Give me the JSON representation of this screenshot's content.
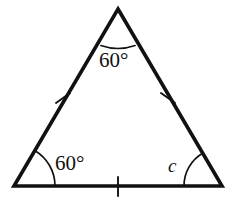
{
  "figure": {
    "type": "geometry-diagram",
    "shape": "equilateral-triangle",
    "background_color": "#ffffff",
    "stroke_color": "#111111",
    "canvas": {
      "width": 236,
      "height": 209
    }
  },
  "vertices": {
    "apex": {
      "label": "apex",
      "x": 118,
      "y": 9
    },
    "bottom_left": {
      "label": "bottom-left",
      "x": 14,
      "y": 186
    },
    "bottom_right": {
      "label": "bottom-right",
      "x": 222,
      "y": 186
    }
  },
  "labels": {
    "apex_angle": "60°",
    "bottom_left_angle": "60°",
    "bottom_right_angle": "c"
  },
  "angle_marks": [
    {
      "name": "apex-angle-arc",
      "vertex": "apex",
      "value": "60°",
      "radius": 38
    },
    {
      "name": "bottom-left-angle-arc",
      "vertex": "bottom_left",
      "value": "60°",
      "radius": 41
    },
    {
      "name": "bottom-right-angle-arc",
      "vertex": "bottom_right",
      "value": "c",
      "radius": 38
    }
  ],
  "side_marks": [
    {
      "name": "left-side-tick",
      "side": "left",
      "ticks": 1
    },
    {
      "name": "right-side-tick",
      "side": "right",
      "ticks": 1
    },
    {
      "name": "base-tick",
      "side": "base",
      "ticks": 1
    }
  ]
}
